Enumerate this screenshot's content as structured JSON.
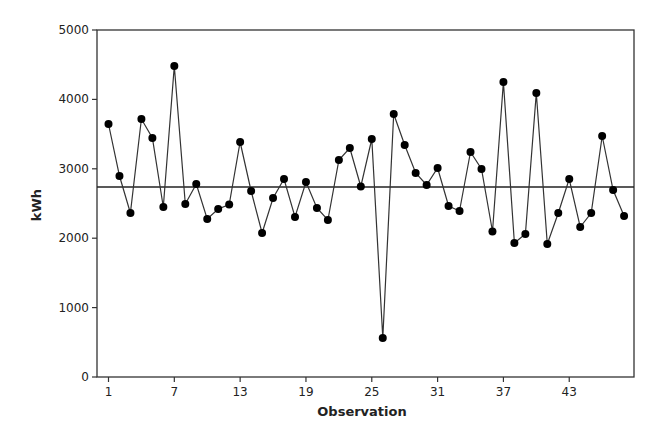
{
  "chart_data": {
    "type": "line",
    "title": "",
    "xlabel": "Observation",
    "ylabel": "kWh",
    "ylim": [
      0,
      5000
    ],
    "xlim": [
      0,
      48.5
    ],
    "grid": false,
    "legend": null,
    "yticks": [
      0,
      1000,
      2000,
      3000,
      4000,
      5000
    ],
    "ytick_labels": [
      "0",
      "1000",
      "2000",
      "3000",
      "4000",
      "5000"
    ],
    "xticks": [
      1,
      7,
      13,
      19,
      25,
      31,
      37,
      43
    ],
    "xtick_labels": [
      "1",
      "7",
      "13",
      "19",
      "25",
      "31",
      "37",
      "43"
    ],
    "x": [
      1,
      2,
      3,
      4,
      5,
      6,
      7,
      8,
      9,
      10,
      11,
      12,
      13,
      14,
      15,
      16,
      17,
      18,
      19,
      20,
      21,
      22,
      23,
      24,
      25,
      26,
      27,
      28,
      29,
      30,
      31,
      32,
      33,
      34,
      35,
      36,
      37,
      38,
      39,
      40,
      41,
      42,
      43,
      44,
      45,
      46,
      47,
      48
    ],
    "series": [
      {
        "name": "kWh",
        "marker": "filled-circle",
        "color": "#000000",
        "values": [
          3645,
          2896,
          2363,
          3718,
          3444,
          2450,
          4481,
          2493,
          2781,
          2277,
          2421,
          2485,
          3386,
          2680,
          2075,
          2579,
          2853,
          2305,
          2810,
          2435,
          2262,
          3127,
          3300,
          2745,
          3429,
          562,
          3790,
          3343,
          2940,
          2767,
          3012,
          2464,
          2392,
          3242,
          2997,
          2097,
          4251,
          1931,
          2061,
          4092,
          1916,
          2363,
          2853,
          2161,
          2363,
          3473,
          2695,
          2320
        ]
      }
    ],
    "reference_line": {
      "label": "Center line (mean)",
      "value": 2738,
      "color": "#000000"
    },
    "colors": {
      "line": "#333333",
      "marker": "#000000",
      "axis": "#333333",
      "background": "#ffffff"
    }
  }
}
